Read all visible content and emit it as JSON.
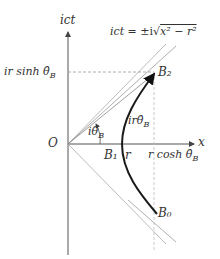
{
  "diagram": {
    "axis_vertical_label": "ict",
    "axis_horizontal_label": "x",
    "origin_label": "O",
    "curve_equation": "ict = ±i√(x² − r²)",
    "eq_lhs": "ict",
    "eq_rhs_prefix": "= ±i",
    "eq_radicand": "x² − r²",
    "point_b0": "B₀",
    "point_b1": "B₁",
    "point_b2": "B₂",
    "label_r": "r",
    "label_angle": "iθ̂",
    "label_angle_sub": "B",
    "label_arc": "irθ̂",
    "label_arc_sub": "B",
    "label_sinh_prefix": "ir sinh θ̂",
    "label_sinh_sub": "B",
    "label_cosh_prefix": "r cosh θ̂",
    "label_cosh_sub": "B",
    "colors": {
      "curve": "#1a1a1a",
      "axes": "#555555",
      "asymptote": "#888888",
      "dashed": "#999999"
    }
  }
}
